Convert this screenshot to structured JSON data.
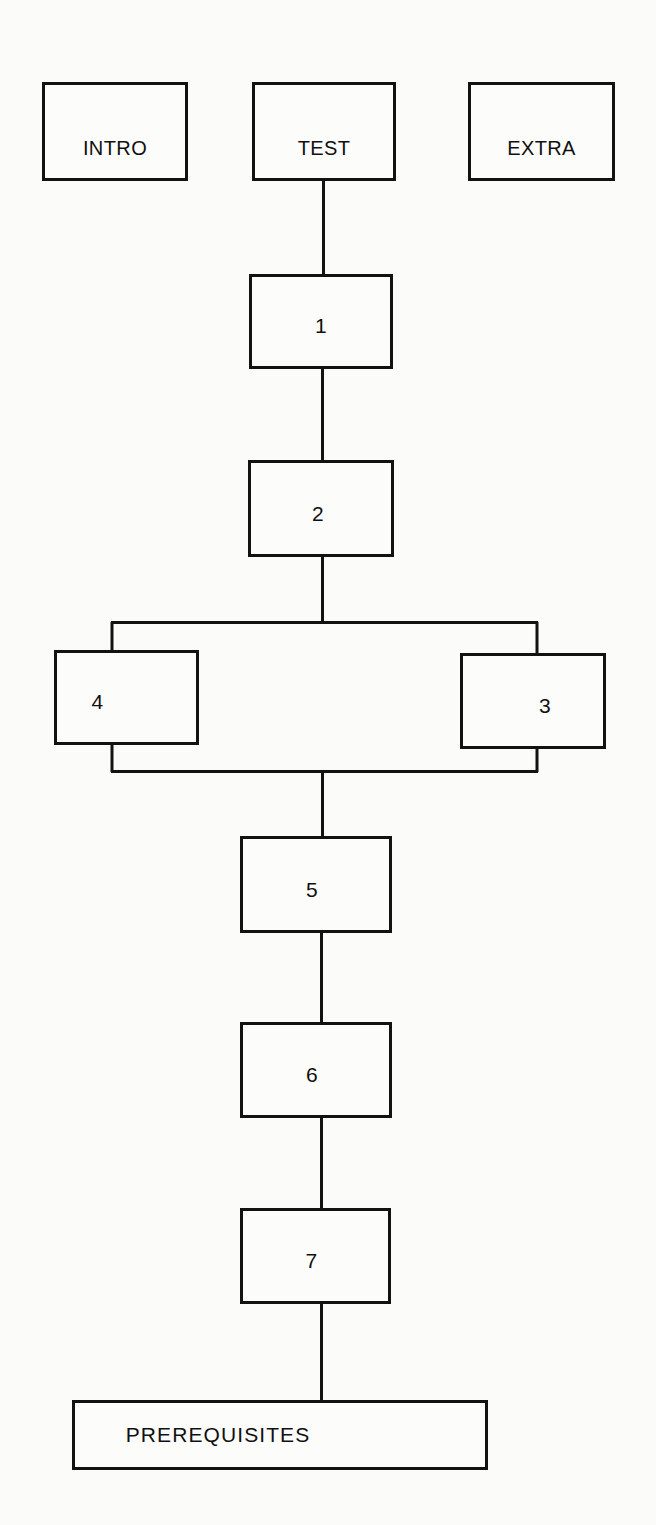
{
  "diagram": {
    "background_color": "#fbfbfa",
    "line_color": "#121212",
    "text_color": "#101010",
    "width": 656,
    "height": 1525,
    "nodes": [
      {
        "id": "intro",
        "label": "INTRO",
        "kind": "terminal"
      },
      {
        "id": "test",
        "label": "TEST",
        "kind": "terminal"
      },
      {
        "id": "extra",
        "label": "EXTRA",
        "kind": "terminal"
      },
      {
        "id": "step1",
        "label": "1",
        "kind": "step"
      },
      {
        "id": "step2",
        "label": "2",
        "kind": "step"
      },
      {
        "id": "step4",
        "label": "4",
        "kind": "step"
      },
      {
        "id": "step3",
        "label": "3",
        "kind": "step"
      },
      {
        "id": "step5",
        "label": "5",
        "kind": "step"
      },
      {
        "id": "step6",
        "label": "6",
        "kind": "step"
      },
      {
        "id": "step7",
        "label": "7",
        "kind": "step"
      },
      {
        "id": "prerequisites",
        "label": "PREREQUISITES",
        "kind": "footer"
      }
    ],
    "edges": [
      {
        "from": "test",
        "to": "step1"
      },
      {
        "from": "step1",
        "to": "step2"
      },
      {
        "from": "step2",
        "to": "step4"
      },
      {
        "from": "step2",
        "to": "step3"
      },
      {
        "from": "step4",
        "to": "step5"
      },
      {
        "from": "step3",
        "to": "step5"
      },
      {
        "from": "step5",
        "to": "step6"
      },
      {
        "from": "step6",
        "to": "step7"
      },
      {
        "from": "step7",
        "to": "prerequisites"
      }
    ]
  }
}
